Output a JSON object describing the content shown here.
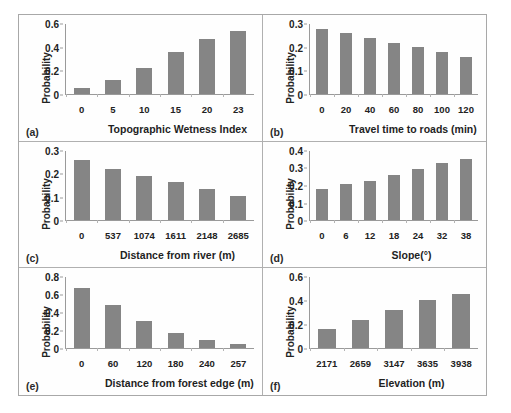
{
  "figure": {
    "panel_count": 6,
    "bar_color": "#858585",
    "axis_color": "#9a9a9a",
    "background": "#fefefe"
  },
  "chart_data": [
    {
      "type": "bar",
      "tag": "(a)",
      "title": "",
      "xlabel": "Topographic Wetness Index",
      "ylabel": "Probability",
      "categories": [
        "0",
        "5",
        "10",
        "15",
        "20",
        "23"
      ],
      "values": [
        0.045,
        0.12,
        0.22,
        0.355,
        0.475,
        0.54
      ],
      "ylim": [
        0,
        0.6
      ],
      "yticks": [
        "0",
        "0.2",
        "0.4",
        "0.6"
      ],
      "ytick_values": [
        0,
        0.2,
        0.4,
        0.6
      ],
      "grid": false,
      "legend": "none"
    },
    {
      "type": "bar",
      "tag": "(b)",
      "title": "",
      "xlabel": "Travel time to roads (min)",
      "ylabel": "Probability",
      "categories": [
        "0",
        "20",
        "40",
        "60",
        "80",
        "100",
        "120"
      ],
      "values": [
        0.28,
        0.26,
        0.24,
        0.22,
        0.2,
        0.18,
        0.16
      ],
      "ylim": [
        0,
        0.3
      ],
      "yticks": [
        "0",
        "0.1",
        "0.2",
        "0.3"
      ],
      "ytick_values": [
        0,
        0.1,
        0.2,
        0.3
      ],
      "grid": false,
      "legend": "none"
    },
    {
      "type": "bar",
      "tag": "(c)",
      "title": "",
      "xlabel": "Distance from river (m)",
      "ylabel": "Probability",
      "categories": [
        "0",
        "537",
        "1074",
        "1611",
        "2148",
        "2685"
      ],
      "values": [
        0.26,
        0.222,
        0.191,
        0.164,
        0.133,
        0.104
      ],
      "ylim": [
        0,
        0.3
      ],
      "yticks": [
        "0",
        "0.1",
        "0.2",
        "0.3"
      ],
      "ytick_values": [
        0,
        0.1,
        0.2,
        0.3
      ],
      "grid": false,
      "legend": "none"
    },
    {
      "type": "bar",
      "tag": "(d)",
      "title": "",
      "xlabel": "Slope(°)",
      "ylabel": "Probability",
      "categories": [
        "0",
        "6",
        "12",
        "18",
        "24",
        "32",
        "38"
      ],
      "values": [
        0.178,
        0.211,
        0.228,
        0.259,
        0.292,
        0.329,
        0.351
      ],
      "ylim": [
        0,
        0.4
      ],
      "yticks": [
        "0",
        "0.1",
        "0.2",
        "0.3",
        "0.4"
      ],
      "ytick_values": [
        0,
        0.1,
        0.2,
        0.3,
        0.4
      ],
      "grid": false,
      "legend": "none"
    },
    {
      "type": "bar",
      "tag": "(e)",
      "title": "",
      "xlabel": "Distance from forest edge (m)",
      "ylabel": "Probability",
      "categories": [
        "0",
        "60",
        "120",
        "180",
        "240",
        "257"
      ],
      "values": [
        0.68,
        0.485,
        0.31,
        0.17,
        0.085,
        0.05
      ],
      "ylim": [
        0,
        0.8
      ],
      "yticks": [
        "0",
        "0.2",
        "0.4",
        "0.6",
        "0.8"
      ],
      "ytick_values": [
        0,
        0.2,
        0.4,
        0.6,
        0.8
      ],
      "grid": false,
      "legend": "none"
    },
    {
      "type": "bar",
      "tag": "(f)",
      "title": "",
      "xlabel": "Elevation (m)",
      "ylabel": "Probability",
      "categories": [
        "2171",
        "2659",
        "3147",
        "3635",
        "3938"
      ],
      "values": [
        0.16,
        0.24,
        0.32,
        0.41,
        0.46
      ],
      "ylim": [
        0,
        0.6
      ],
      "yticks": [
        "0",
        "0.2",
        "0.4",
        "0.6"
      ],
      "ytick_values": [
        0,
        0.2,
        0.4,
        0.6
      ],
      "grid": false,
      "legend": "none"
    }
  ]
}
